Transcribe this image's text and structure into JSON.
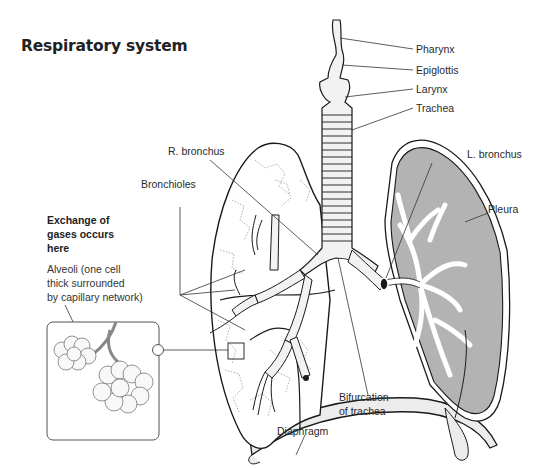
{
  "title": "Respiratory system",
  "labels": {
    "pharynx": "Pharynx",
    "epiglottis": "Epiglottis",
    "larynx": "Larynx",
    "trachea": "Trachea",
    "r_bronchus": "R. bronchus",
    "l_bronchus": "L. bronchus",
    "bronchioles": "Bronchioles",
    "pleura": "Pleura",
    "bifurcation_line1": "Bifurcation",
    "bifurcation_line2": "of trachea",
    "diaphragm": "Diaphragm"
  },
  "note": {
    "heading": [
      "Exchange of",
      "gases occurs",
      "here"
    ],
    "body": [
      "Alveoli (one cell",
      "thick surrounded",
      "by capillary network)"
    ]
  },
  "colors": {
    "line": "#1a1a1a",
    "lung_fill": "#b3b3b3",
    "diaphragm_fill": "#ececec",
    "trachea_fill": "#f2f2f2"
  }
}
